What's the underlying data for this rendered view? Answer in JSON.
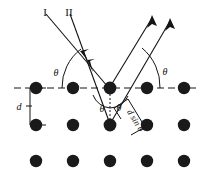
{
  "figure": {
    "type": "physics-diagram",
    "width": 202,
    "height": 179,
    "background_color": "#ffffff",
    "ink_color": "#141414"
  },
  "labels": {
    "ray_one": "I",
    "ray_two": "II",
    "theta_incident_left": "θ",
    "theta_reflected_right": "θ",
    "theta_center_left": "θ",
    "theta_center_right": "θ",
    "spacing_d": "d",
    "path_difference": "d sin θ"
  },
  "lattice": {
    "rows": 3,
    "columns": 5,
    "atom_radius": 6.2,
    "atom_color": "#1a1a1a",
    "row_y": [
      88,
      125,
      161
    ],
    "column_x": [
      36,
      73,
      110,
      147,
      184
    ],
    "plane_line_y": 88,
    "plane_line_style": "dashed"
  },
  "rays": {
    "incident": [
      {
        "name": "I",
        "x1": 46,
        "y1": 14,
        "x2": 108,
        "y2": 87
      },
      {
        "name": "II",
        "x1": 70,
        "y1": 14,
        "x2": 110,
        "y2": 124
      }
    ],
    "reflected": [
      {
        "name": "I-out",
        "x1": 110,
        "y1": 87,
        "x2": 152,
        "y2": 17
      },
      {
        "name": "II-out",
        "x1": 110,
        "y1": 124,
        "x2": 170,
        "y2": 20
      }
    ]
  },
  "annotations": {
    "d_bracket_x": 30,
    "d_bracket_top": 88,
    "d_bracket_bottom": 125,
    "drop_line_x": 110,
    "drop_line_top": 88,
    "drop_line_bottom": 124
  }
}
